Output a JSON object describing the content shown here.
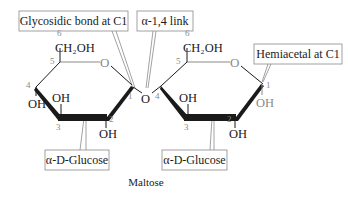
{
  "title": "Maltose",
  "colors": {
    "bond": "#1a1a1a",
    "thin_bond": "#8a8a8a",
    "label_border": "#8a8a8a",
    "carbon_numbers": "#8a8a8a"
  },
  "callouts": {
    "glycosidic": "Glycosidic bond at C1",
    "link": "α-1,4 link",
    "hemiacetal": "Hemiacetal at C1",
    "glucose_left": "α-D-Glucose",
    "glucose_right": "α-D-Glucose"
  },
  "left_ring": {
    "ch2oh": "CH₂OH",
    "ring_oxygen": "O",
    "oh_c4": "OH",
    "oh_c3": "OH",
    "oh_c2": "OH",
    "numbers": {
      "c1": "1",
      "c2": "2",
      "c3": "3",
      "c4": "4",
      "c5": "5",
      "c6": "6"
    }
  },
  "bridge_oxygen": "O",
  "right_ring": {
    "ch2oh": "CH₂OH",
    "ring_oxygen": "O",
    "oh_c3": "OH",
    "oh_c2": "OH",
    "oh_c1": "OH",
    "numbers": {
      "c1": "1",
      "c2": "2",
      "c3": "3",
      "c4": "4",
      "c5": "5",
      "c6": "6"
    }
  }
}
